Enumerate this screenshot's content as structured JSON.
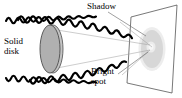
{
  "figure": {
    "labels": {
      "solid_disk": "Solid\ndisk",
      "shadow": "Shadow",
      "bright_spot": "Bright\nspot"
    },
    "colors": {
      "background": "#ffffff",
      "wave_stroke": "#000000",
      "disk_fill": "#b0b0b0",
      "disk_stroke": "#4d4d4d",
      "screen_stroke": "#555555",
      "shadow_fill": "#c9c9c9",
      "bright_spot_fill": "#e8e8e8",
      "leader_line": "#777777",
      "text": "#000000"
    },
    "elements": {
      "solid_disk": "gray-ellipse-disk",
      "screen": "tilted-rectangular-screen",
      "shadow_patch": "gray-elliptical-shadow",
      "bright_spot": "light-circular-spot",
      "waves": [
        "upper-wavy-ray",
        "lower-wavy-ray"
      ],
      "leaders": [
        "shadow-leader-line",
        "bright-spot-leader-line"
      ]
    }
  }
}
